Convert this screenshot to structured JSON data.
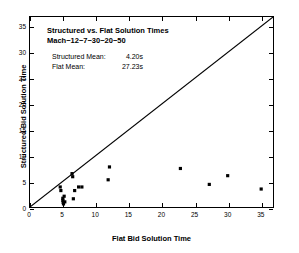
{
  "chart_data": {
    "type": "scatter",
    "title": "Structured vs. Flat Solution Times",
    "subtitle": "Mach−12−7−30−20−50",
    "xlabel": "Flat Bid Solution Time",
    "ylabel": "Structured Bid Solution Time",
    "xlim": [
      0,
      37
    ],
    "ylim": [
      0,
      37
    ],
    "xticks": [
      0,
      5,
      10,
      15,
      20,
      25,
      30,
      35
    ],
    "yticks": [
      0,
      5,
      10,
      15,
      20,
      25,
      30,
      35
    ],
    "xtick_labels": [
      "0",
      "5",
      "10",
      "15",
      "20",
      "25",
      "30",
      "35"
    ],
    "ytick_labels": [
      "0",
      "5",
      "10",
      "15",
      "20",
      "25",
      "30",
      "35"
    ],
    "grid": false,
    "legend": null,
    "marker": "square",
    "marker_color": "#000000",
    "marker_size": 3.2,
    "reference_line": {
      "name": "y = x identity line",
      "from": [
        0,
        0
      ],
      "to": [
        37,
        37
      ],
      "color": "#000000",
      "width": 1.1
    },
    "series": [
      {
        "name": "Solution time pairs",
        "points": [
          [
            4.6,
            3.9
          ],
          [
            4.7,
            3.2
          ],
          [
            5.0,
            1.7
          ],
          [
            5.0,
            1.3
          ],
          [
            5.05,
            0.9
          ],
          [
            5.1,
            0.6
          ],
          [
            5.2,
            2.1
          ],
          [
            5.3,
            1.0
          ],
          [
            6.4,
            6.5
          ],
          [
            6.5,
            5.9
          ],
          [
            6.6,
            1.6
          ],
          [
            6.8,
            3.2
          ],
          [
            7.4,
            3.9
          ],
          [
            7.9,
            3.9
          ],
          [
            11.9,
            5.3
          ],
          [
            12.1,
            7.8
          ],
          [
            22.9,
            7.5
          ],
          [
            27.3,
            4.4
          ],
          [
            30.1,
            6.1
          ],
          [
            35.2,
            3.5
          ]
        ]
      }
    ],
    "annotations": {
      "structured_mean_label": "Structured Mean:",
      "structured_mean_value": "4.20s",
      "flat_mean_label": "Flat Mean:",
      "flat_mean_value": "27.23s"
    }
  }
}
